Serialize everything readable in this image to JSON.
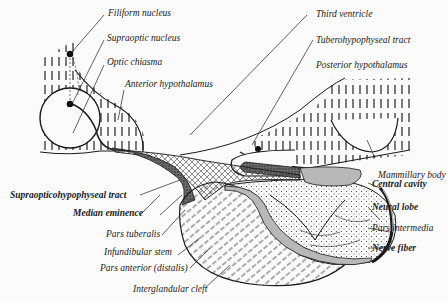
{
  "diagram": {
    "type": "anatomical-illustration",
    "labels": [
      {
        "id": "filiform_nucleus",
        "text": "Filiform nucleus"
      },
      {
        "id": "supraoptic_nucleus",
        "text": "Supraoptic nucleus"
      },
      {
        "id": "optic_chiasma",
        "text": "Optic chiasma"
      },
      {
        "id": "anterior_hypothalamus",
        "text": "Anterior hypothalamus"
      },
      {
        "id": "third_ventricle",
        "text": "Third ventricle"
      },
      {
        "id": "tuberohypophyseal_tract",
        "text": "Tuberohypophyseal tract"
      },
      {
        "id": "posterior_hypothalamus",
        "text": "Posterior hypothalamus"
      },
      {
        "id": "mammillary_body",
        "text": "Mammillary body"
      },
      {
        "id": "central_cavity",
        "text": "Central cavity"
      },
      {
        "id": "neural_lobe",
        "text": "Neural lobe"
      },
      {
        "id": "pars_intermedia",
        "text": "Pars intermedia"
      },
      {
        "id": "nerve_fiber",
        "text": "Nerve fiber"
      },
      {
        "id": "supraopticohypophyseal_tract",
        "text": "Supraopticohypophyseal tract"
      },
      {
        "id": "median_eminence",
        "text": "Median eminence"
      },
      {
        "id": "pars_tuberalis",
        "text": "Pars tuberalis"
      },
      {
        "id": "infundibular_stem",
        "text": "Infundibular stem"
      },
      {
        "id": "pars_anterior",
        "text": "Pars anterior (distalis)"
      },
      {
        "id": "interglandular_cleft",
        "text": "Interglandular cleft"
      }
    ],
    "colors": {
      "background": "#fbfbfb",
      "ink": "#1a1a1a",
      "dark_tract": "#555555",
      "gray_region": "#b8b8b8"
    }
  }
}
